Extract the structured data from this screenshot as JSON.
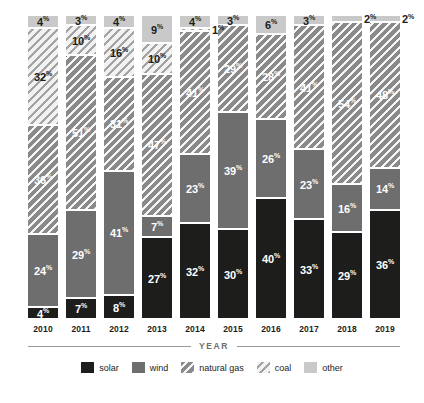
{
  "chart_data": {
    "type": "bar",
    "stacked": true,
    "stack_mode": "percent",
    "title": "",
    "subtitle": "",
    "xlabel": "YEAR",
    "ylabel": "",
    "ylim": [
      0,
      100
    ],
    "grid": false,
    "legend_position": "bottom",
    "value_suffix": "%",
    "categories": [
      "2010",
      "2011",
      "2012",
      "2013",
      "2014",
      "2015",
      "2016",
      "2017",
      "2018",
      "2019"
    ],
    "series": [
      {
        "name": "solar",
        "color": "#1d1d1b",
        "pattern": "solid",
        "values": [
          4,
          7,
          8,
          27,
          32,
          30,
          40,
          33,
          29,
          36
        ]
      },
      {
        "name": "wind",
        "color": "#6e6e6e",
        "pattern": "solid",
        "values": [
          24,
          29,
          41,
          7,
          23,
          39,
          26,
          23,
          16,
          14
        ]
      },
      {
        "name": "natural gas",
        "color": "#8a8a8a",
        "pattern": "diagonal-hatch-dark",
        "values": [
          36,
          51,
          31,
          47,
          41,
          29,
          28,
          41,
          54,
          48
        ]
      },
      {
        "name": "coal",
        "color": "#f2f2f2",
        "pattern": "diagonal-hatch-light",
        "values": [
          32,
          10,
          16,
          10,
          1,
          0,
          0,
          0,
          0,
          0
        ]
      },
      {
        "name": "other",
        "color": "#c9c9c9",
        "pattern": "solid",
        "values": [
          4,
          3,
          4,
          9,
          4,
          3,
          6,
          3,
          2,
          2
        ]
      }
    ]
  },
  "legend": {
    "items": [
      {
        "label": "solar"
      },
      {
        "label": "wind"
      },
      {
        "label": "natural gas"
      },
      {
        "label": "coal"
      },
      {
        "label": "other"
      }
    ]
  },
  "axis": {
    "x_title": "YEAR"
  },
  "caption": {
    "text": ""
  }
}
